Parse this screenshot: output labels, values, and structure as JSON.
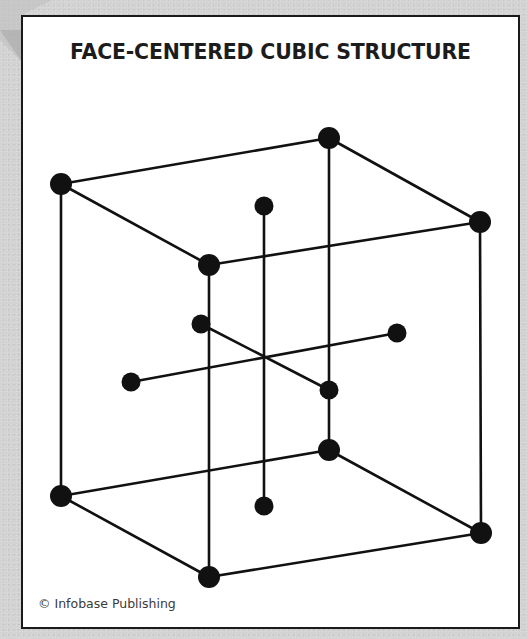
{
  "diagram": {
    "title": "FACE-CENTERED CUBIC STRUCTURE",
    "credit": "© Infobase Publishing",
    "colors": {
      "background": "#d3d3d3",
      "frame_fill": "#ffffff",
      "ink": "#111111",
      "credit_text": "#3a3a3a"
    },
    "nodes": [
      {
        "id": "top-back-left",
        "x": 61,
        "y": 184,
        "r": 11
      },
      {
        "id": "top-back-right",
        "x": 329,
        "y": 138,
        "r": 11
      },
      {
        "id": "top-front-right",
        "x": 480,
        "y": 222,
        "r": 11
      },
      {
        "id": "top-front-left",
        "x": 209,
        "y": 265,
        "r": 11
      },
      {
        "id": "bottom-back-left",
        "x": 61,
        "y": 496,
        "r": 11
      },
      {
        "id": "bottom-back-right",
        "x": 329,
        "y": 450,
        "r": 11
      },
      {
        "id": "bottom-front-right",
        "x": 481,
        "y": 533,
        "r": 11
      },
      {
        "id": "bottom-front-left",
        "x": 209,
        "y": 577,
        "r": 11
      },
      {
        "id": "face-top",
        "x": 264,
        "y": 206,
        "r": 9.5
      },
      {
        "id": "face-bottom",
        "x": 264,
        "y": 506,
        "r": 9.5
      },
      {
        "id": "face-back-left",
        "x": 201,
        "y": 324,
        "r": 9.5
      },
      {
        "id": "face-front-right",
        "x": 329,
        "y": 390,
        "r": 9.5
      },
      {
        "id": "face-left",
        "x": 131,
        "y": 382,
        "r": 9.5
      },
      {
        "id": "face-right",
        "x": 397,
        "y": 333,
        "r": 9.5
      }
    ],
    "edges": [
      [
        "top-back-left",
        "top-back-right"
      ],
      [
        "top-back-right",
        "top-front-right"
      ],
      [
        "top-front-right",
        "top-front-left"
      ],
      [
        "top-front-left",
        "top-back-left"
      ],
      [
        "bottom-back-left",
        "bottom-back-right"
      ],
      [
        "bottom-back-right",
        "bottom-front-right"
      ],
      [
        "bottom-front-right",
        "bottom-front-left"
      ],
      [
        "bottom-front-left",
        "bottom-back-left"
      ],
      [
        "top-back-left",
        "bottom-back-left"
      ],
      [
        "top-back-right",
        "bottom-back-right"
      ],
      [
        "top-front-right",
        "bottom-front-right"
      ],
      [
        "top-front-left",
        "bottom-front-left"
      ],
      [
        "face-top",
        "face-bottom"
      ],
      [
        "face-back-left",
        "face-front-right"
      ],
      [
        "face-left",
        "face-right"
      ]
    ],
    "stroke_width": 2.6
  }
}
